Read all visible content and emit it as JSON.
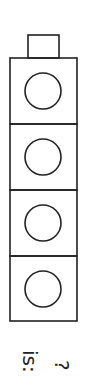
{
  "figure": {
    "type": "stacked-boxes",
    "tab": {
      "x": 28,
      "y": 35,
      "w": 31,
      "h": 23
    },
    "column": {
      "x": 10,
      "y": 58,
      "w": 67,
      "box_h": 66
    },
    "boxes": [
      {
        "index": 0,
        "shape": "circle"
      },
      {
        "index": 1,
        "shape": "circle"
      },
      {
        "index": 2,
        "shape": "circle"
      },
      {
        "index": 3,
        "shape": "circle"
      }
    ],
    "circle_radius": 18,
    "stroke_color": "#222222"
  },
  "labels": {
    "is_label": "is:",
    "question_label": "?"
  }
}
